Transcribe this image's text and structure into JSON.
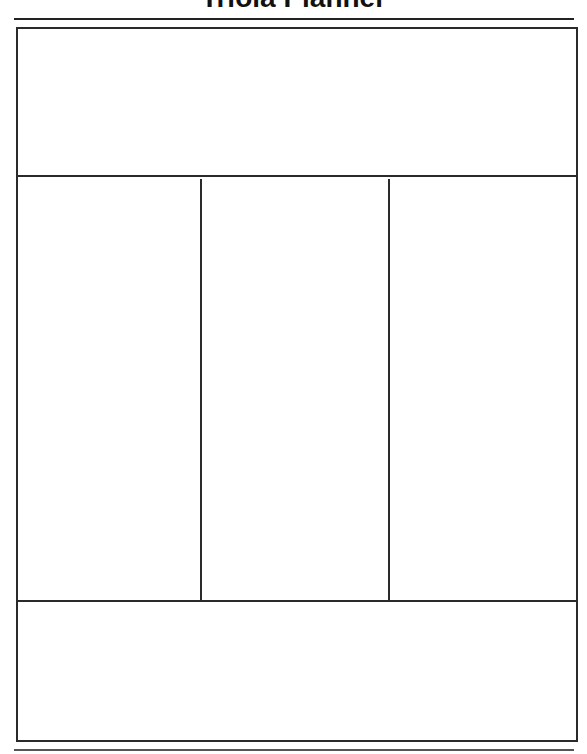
{
  "header": {
    "title": "Triola Planner"
  },
  "layout": {
    "sections": [
      {
        "id": "top",
        "label": ""
      },
      {
        "id": "column-1",
        "label": ""
      },
      {
        "id": "column-2",
        "label": ""
      },
      {
        "id": "column-3",
        "label": ""
      },
      {
        "id": "bottom",
        "label": ""
      }
    ],
    "line_color": "#2a2a2a",
    "background_color": "#ffffff"
  }
}
